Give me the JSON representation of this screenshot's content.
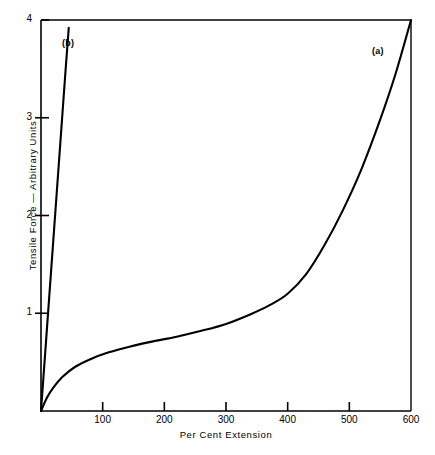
{
  "chart_data": {
    "type": "line",
    "title": "",
    "xlabel": "Per Cent Extension",
    "ylabel": "Tensile Force — Arbitrary Units",
    "xlim": [
      0,
      600
    ],
    "ylim": [
      0,
      4
    ],
    "xticks": [
      100,
      200,
      300,
      400,
      500,
      600
    ],
    "yticks": [
      1,
      2,
      3,
      4
    ],
    "xtick_labels": [
      "100",
      "200",
      "300",
      "400",
      "500",
      "600"
    ],
    "ytick_labels": [
      "1",
      "2",
      "3",
      "4"
    ],
    "grid": false,
    "legend": "inline-annotations",
    "series": [
      {
        "name": "(a)",
        "label": "(a)",
        "annotation": "(a)",
        "color": "#000000",
        "x": [
          0,
          10,
          20,
          35,
          55,
          80,
          110,
          145,
          180,
          220,
          260,
          300,
          340,
          370,
          400,
          430,
          460,
          490,
          520,
          550,
          575,
          600
        ],
        "y": [
          0,
          0.14,
          0.24,
          0.35,
          0.45,
          0.53,
          0.6,
          0.66,
          0.71,
          0.76,
          0.82,
          0.89,
          0.99,
          1.08,
          1.2,
          1.4,
          1.7,
          2.06,
          2.48,
          2.98,
          3.45,
          4.0
        ]
      },
      {
        "name": "(b)",
        "label": "(b)",
        "annotation": "(b)",
        "color": "#000000",
        "x": [
          0,
          8,
          16,
          24,
          32,
          40,
          45
        ],
        "y": [
          0,
          0.7,
          1.4,
          2.1,
          2.8,
          3.5,
          3.92
        ]
      }
    ],
    "annotations": [
      {
        "text": "(a)",
        "x": 545,
        "y": 3.62
      },
      {
        "text": "(b)",
        "x": 62,
        "y": 3.62
      }
    ]
  },
  "axes": {
    "frame_color": "#000000",
    "background": "#ffffff"
  },
  "caption": {
    "text": ""
  }
}
